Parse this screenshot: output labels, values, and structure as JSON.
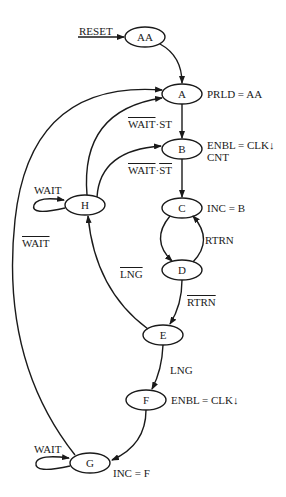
{
  "diagram": {
    "type": "state-diagram",
    "states": [
      {
        "id": "AA",
        "label": "AA"
      },
      {
        "id": "A",
        "label": "A",
        "output": "PRLD = AA"
      },
      {
        "id": "B",
        "label": "B",
        "output": "ENBL = CLK↓",
        "output2": "CNT"
      },
      {
        "id": "C",
        "label": "C",
        "output": "INC = B"
      },
      {
        "id": "D",
        "label": "D"
      },
      {
        "id": "E",
        "label": "E"
      },
      {
        "id": "F",
        "label": "F",
        "output": "ENBL = CLK↓"
      },
      {
        "id": "G",
        "label": "G",
        "output": "INC = F"
      },
      {
        "id": "H",
        "label": "H"
      }
    ],
    "transitions": [
      {
        "from": "RESET",
        "to": "AA",
        "label": "RESET"
      },
      {
        "from": "AA",
        "to": "A",
        "label": ""
      },
      {
        "from": "A",
        "to": "B",
        "label_a": "WAIT",
        "label_b": "·ST",
        "note": "WAIT overlined"
      },
      {
        "from": "H",
        "to": "A",
        "label": ""
      },
      {
        "from": "H",
        "to": "B",
        "label_a": "WAIT",
        "label_sep": "·",
        "label_b": "ST",
        "note": "both overlined"
      },
      {
        "from": "H",
        "to": "H",
        "label": "WAIT"
      },
      {
        "from": "B",
        "to": "C",
        "label": ""
      },
      {
        "from": "C",
        "to": "D",
        "label": ""
      },
      {
        "from": "D",
        "to": "C",
        "label": "RTRN"
      },
      {
        "from": "D",
        "to": "E",
        "label": "RTRN",
        "note": "overlined"
      },
      {
        "from": "E",
        "to": "H",
        "label": "LNG",
        "note": "overlined"
      },
      {
        "from": "E",
        "to": "F",
        "label": "LNG"
      },
      {
        "from": "F",
        "to": "G",
        "label": ""
      },
      {
        "from": "G",
        "to": "G",
        "label": "WAIT"
      },
      {
        "from": "G",
        "to": "A",
        "label": "WAIT",
        "note": "overlined"
      }
    ]
  }
}
